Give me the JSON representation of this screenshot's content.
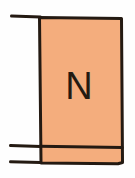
{
  "figure": {
    "background_color": "#fefefe",
    "block": {
      "label": "N",
      "fill_color": "#f4ad7d",
      "stroke_color": "#241a12",
      "x": 38,
      "y": 16,
      "width": 84,
      "height": 148
    },
    "band": {
      "name": "bottom-band",
      "divider_y": 146,
      "fill_color": "#f4ad7d"
    },
    "leads": [
      {
        "name": "top-lead",
        "x1": 11,
        "y1": 16,
        "x2": 40,
        "y2": 16
      },
      {
        "name": "bottom-lead-upper",
        "x1": 10,
        "y1": 146,
        "x2": 40,
        "y2": 146
      },
      {
        "name": "bottom-lead-lower",
        "x1": 10,
        "y1": 162,
        "x2": 40,
        "y2": 162
      }
    ],
    "stroke_width": 3
  }
}
